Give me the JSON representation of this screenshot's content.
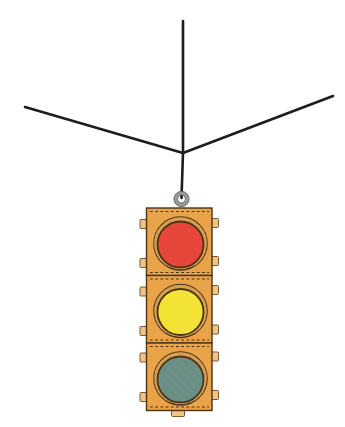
{
  "wires": {
    "color": "#1d1d1d"
  },
  "traffic_light": {
    "body_color": "#e9a44a",
    "socket_color": "#eeb262",
    "outline_color": "#4a3319",
    "rim_color": "#d7a050",
    "stitch_color": "#4a3319",
    "tab_color": "#eec489",
    "ring_color": "#9b9b9b",
    "lights": [
      {
        "name": "red-light",
        "color": "#e7463a"
      },
      {
        "name": "yellow-light",
        "color": "#f2e335"
      },
      {
        "name": "green-light",
        "color": "#6d9086",
        "hatch_color": "#5d7f75"
      }
    ]
  }
}
